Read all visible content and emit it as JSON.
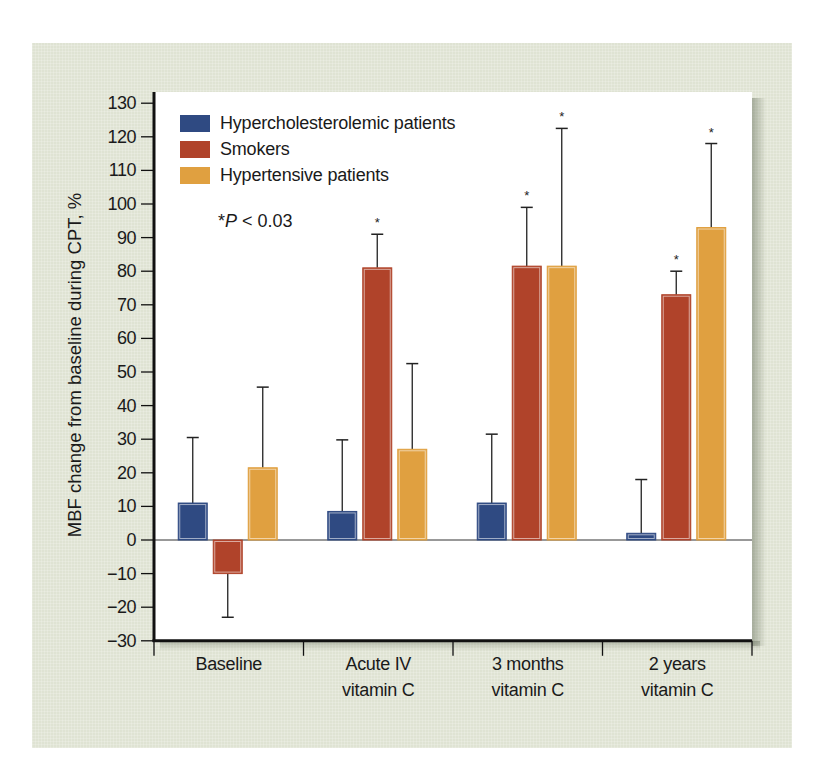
{
  "chart_data": {
    "type": "bar",
    "title": "",
    "xlabel": "",
    "ylabel": "MBF change from baseline during CPT, %",
    "ylim": [
      -30,
      130
    ],
    "yticks": [
      130,
      120,
      110,
      100,
      90,
      80,
      70,
      60,
      50,
      40,
      30,
      20,
      10,
      0,
      -10,
      -20,
      -30
    ],
    "ytick_labels": [
      "130",
      "120",
      "110",
      "100",
      "90",
      "80",
      "70",
      "60",
      "50",
      "40",
      "30",
      "20",
      "10",
      "0",
      "−10",
      "−20",
      "−30"
    ],
    "grid": false,
    "legend_position": "upper left (inside plot)",
    "categories": [
      "Baseline",
      "Acute IV vitamin C",
      "3 months vitamin C",
      "2 years vitamin C"
    ],
    "category_lines": [
      [
        "Baseline"
      ],
      [
        "Acute IV",
        "vitamin C"
      ],
      [
        "3 months",
        "vitamin C"
      ],
      [
        "2 years",
        "vitamin C"
      ]
    ],
    "series": [
      {
        "name": "Hypercholesterolemic patients",
        "color": "#2f4a82",
        "values": [
          11,
          8.5,
          11,
          2
        ],
        "error_upper": [
          30.5,
          29.8,
          31.5,
          18
        ],
        "significant": [
          false,
          false,
          false,
          false
        ]
      },
      {
        "name": "Smokers",
        "color": "#b0432a",
        "values": [
          -10,
          81,
          81.5,
          73
        ],
        "error_upper": [
          -23,
          91,
          99,
          80
        ],
        "significant": [
          false,
          true,
          true,
          true
        ]
      },
      {
        "name": "Hypertensive patients",
        "color": "#e0a040",
        "values": [
          21.5,
          27,
          81.5,
          93
        ],
        "error_upper": [
          45.5,
          52.5,
          122.5,
          118
        ],
        "significant": [
          false,
          false,
          true,
          true
        ]
      }
    ],
    "annotations": [
      {
        "text": "*P < 0.03",
        "meaning": "significance marker"
      }
    ],
    "significance_symbol": "*"
  },
  "legend": {
    "items": [
      {
        "label": "Hypercholesterolemic patients",
        "color": "#2f4a82"
      },
      {
        "label": "Smokers",
        "color": "#b0432a"
      },
      {
        "label": "Hypertensive patients",
        "color": "#e0a040"
      }
    ]
  },
  "annotation": {
    "star": "*",
    "p_letter": "P",
    "rest": " < 0.03"
  },
  "axis": {
    "y_title": "MBF change from baseline during CPT, %"
  },
  "colors": {
    "background": "#dfe3d3",
    "plot": "#ffffff",
    "axis": "#111111"
  }
}
